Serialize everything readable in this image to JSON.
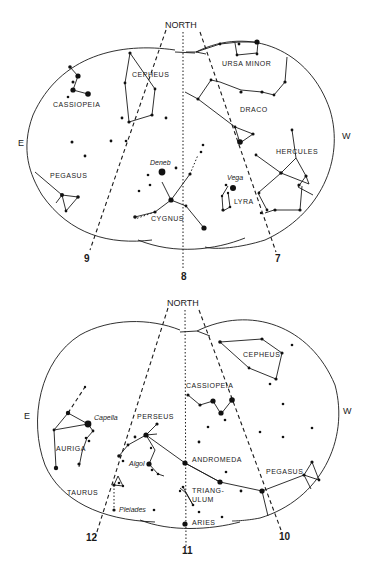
{
  "charts": [
    {
      "id": "top",
      "north_label": "NORTH",
      "east_label": "E",
      "west_label": "W",
      "direction_numbers": [
        "9",
        "8",
        "7"
      ],
      "constellations": [
        "CASSIOPEIA",
        "CEPHEUS",
        "URSA MINOR",
        "DRACO",
        "HERCULES",
        "PEGASUS",
        "CYGNUS",
        "LYRA"
      ],
      "stars": [
        "Deneb",
        "Vega"
      ]
    },
    {
      "id": "bottom",
      "north_label": "NORTH",
      "east_label": "E",
      "west_label": "W",
      "direction_numbers": [
        "12",
        "11",
        "10"
      ],
      "constellations": [
        "CEPHEUS",
        "CASSIOPEIA",
        "PERSEUS",
        "AURIGA",
        "ANDROMEDA",
        "PEGASUS",
        "TAURUS",
        "TRIANG-",
        "ULUM",
        "ARIES"
      ],
      "stars": [
        "Capella",
        "Algol",
        "Pleiades"
      ]
    }
  ],
  "colors": {
    "ink": "#1a1a1a",
    "paper": "#ffffff"
  }
}
